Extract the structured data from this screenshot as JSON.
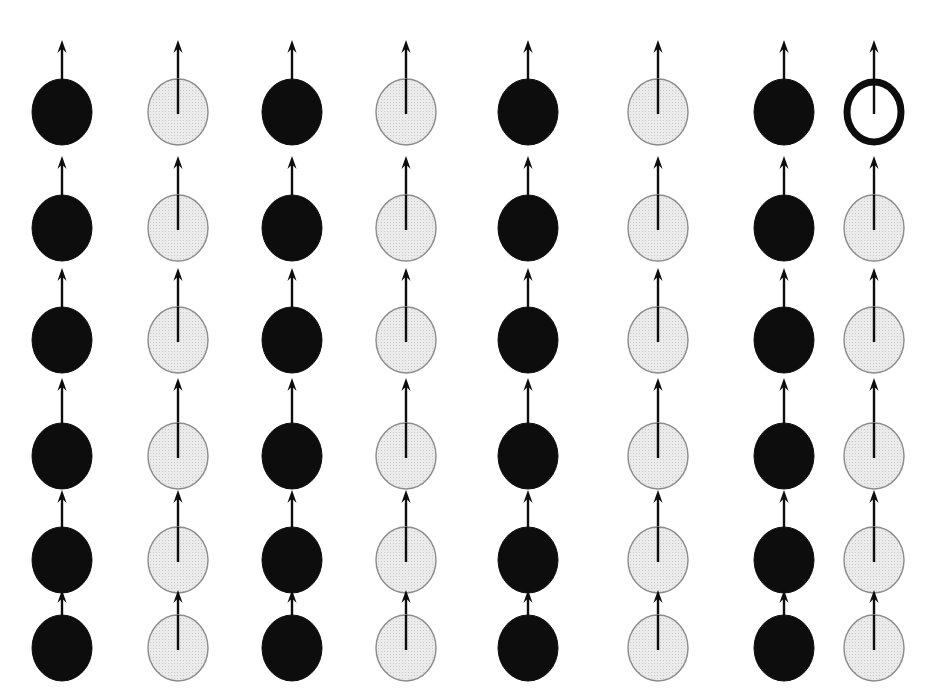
{
  "figure": {
    "canvas": {
      "width": 933,
      "height": 698
    },
    "background_color": "#ffffff"
  },
  "style": {
    "black_sphere_fill": "#0d0d0d",
    "black_sphere_stroke": "#0d0d0d",
    "grey_sphere_fill": "#ebebeb",
    "grey_sphere_stroke": "#8c8c8c",
    "open_circle_fill": "#ffffff",
    "open_circle_stroke": "#0d0d0d",
    "open_circle_stroke_width": 7,
    "arrow_color": "#0d0d0d",
    "arrow_shaft_width": 2.4,
    "grey_stipple_color": "#c9c9c9"
  },
  "lattice": {
    "rows": 6,
    "columns": 8,
    "sphere_radius_x": 30,
    "sphere_radius_y": 33,
    "column_centers_x": [
      62,
      178,
      292,
      406,
      528,
      658,
      784,
      874
    ],
    "row_centers_y": [
      112,
      228,
      340,
      456,
      560,
      648
    ],
    "column_kinds": [
      "black",
      "grey",
      "black",
      "grey",
      "black",
      "grey",
      "black",
      "grey"
    ],
    "arrow_lengths_by_row": [
      72,
      72,
      72,
      78,
      70,
      58
    ],
    "notes": {
      "row_gap_emphasis": "Larger vertical gap between row 3 and row 4",
      "column_gap_emphasis": "Columns 7 and 8 are spaced closer together than the other pairs",
      "bottom_row_clipped": "Bottom row spheres are clipped by the lower image edge"
    },
    "cells": [
      {
        "row": 1,
        "col": 1,
        "kind": "black",
        "arrow": "up"
      },
      {
        "row": 1,
        "col": 2,
        "kind": "grey",
        "arrow": "up"
      },
      {
        "row": 1,
        "col": 3,
        "kind": "black",
        "arrow": "up"
      },
      {
        "row": 1,
        "col": 4,
        "kind": "grey",
        "arrow": "up"
      },
      {
        "row": 1,
        "col": 5,
        "kind": "black",
        "arrow": "up"
      },
      {
        "row": 1,
        "col": 6,
        "kind": "grey",
        "arrow": "up"
      },
      {
        "row": 1,
        "col": 7,
        "kind": "black",
        "arrow": "up"
      },
      {
        "row": 1,
        "col": 8,
        "kind": "open",
        "arrow": "up"
      },
      {
        "row": 2,
        "col": 1,
        "kind": "black",
        "arrow": "up"
      },
      {
        "row": 2,
        "col": 2,
        "kind": "grey",
        "arrow": "up"
      },
      {
        "row": 2,
        "col": 3,
        "kind": "black",
        "arrow": "up"
      },
      {
        "row": 2,
        "col": 4,
        "kind": "grey",
        "arrow": "up"
      },
      {
        "row": 2,
        "col": 5,
        "kind": "black",
        "arrow": "up"
      },
      {
        "row": 2,
        "col": 6,
        "kind": "grey",
        "arrow": "up"
      },
      {
        "row": 2,
        "col": 7,
        "kind": "black",
        "arrow": "up"
      },
      {
        "row": 2,
        "col": 8,
        "kind": "grey",
        "arrow": "up"
      },
      {
        "row": 3,
        "col": 1,
        "kind": "black",
        "arrow": "up"
      },
      {
        "row": 3,
        "col": 2,
        "kind": "grey",
        "arrow": "up"
      },
      {
        "row": 3,
        "col": 3,
        "kind": "black",
        "arrow": "up"
      },
      {
        "row": 3,
        "col": 4,
        "kind": "grey",
        "arrow": "up"
      },
      {
        "row": 3,
        "col": 5,
        "kind": "black",
        "arrow": "up"
      },
      {
        "row": 3,
        "col": 6,
        "kind": "grey",
        "arrow": "up"
      },
      {
        "row": 3,
        "col": 7,
        "kind": "black",
        "arrow": "up"
      },
      {
        "row": 3,
        "col": 8,
        "kind": "grey",
        "arrow": "up"
      },
      {
        "row": 4,
        "col": 1,
        "kind": "black",
        "arrow": "up"
      },
      {
        "row": 4,
        "col": 2,
        "kind": "grey",
        "arrow": "up"
      },
      {
        "row": 4,
        "col": 3,
        "kind": "black",
        "arrow": "up"
      },
      {
        "row": 4,
        "col": 4,
        "kind": "grey",
        "arrow": "up"
      },
      {
        "row": 4,
        "col": 5,
        "kind": "black",
        "arrow": "up"
      },
      {
        "row": 4,
        "col": 6,
        "kind": "grey",
        "arrow": "up"
      },
      {
        "row": 4,
        "col": 7,
        "kind": "black",
        "arrow": "up"
      },
      {
        "row": 4,
        "col": 8,
        "kind": "grey",
        "arrow": "up"
      },
      {
        "row": 5,
        "col": 1,
        "kind": "black",
        "arrow": "up"
      },
      {
        "row": 5,
        "col": 2,
        "kind": "grey",
        "arrow": "up"
      },
      {
        "row": 5,
        "col": 3,
        "kind": "black",
        "arrow": "up"
      },
      {
        "row": 5,
        "col": 4,
        "kind": "grey",
        "arrow": "up"
      },
      {
        "row": 5,
        "col": 5,
        "kind": "black",
        "arrow": "up"
      },
      {
        "row": 5,
        "col": 6,
        "kind": "grey",
        "arrow": "up"
      },
      {
        "row": 5,
        "col": 7,
        "kind": "black",
        "arrow": "up"
      },
      {
        "row": 5,
        "col": 8,
        "kind": "grey",
        "arrow": "up"
      },
      {
        "row": 6,
        "col": 1,
        "kind": "black",
        "arrow": "up"
      },
      {
        "row": 6,
        "col": 2,
        "kind": "grey",
        "arrow": "up"
      },
      {
        "row": 6,
        "col": 3,
        "kind": "black",
        "arrow": "up"
      },
      {
        "row": 6,
        "col": 4,
        "kind": "grey",
        "arrow": "up"
      },
      {
        "row": 6,
        "col": 5,
        "kind": "black",
        "arrow": "up"
      },
      {
        "row": 6,
        "col": 6,
        "kind": "grey",
        "arrow": "up"
      },
      {
        "row": 6,
        "col": 7,
        "kind": "black",
        "arrow": "up"
      },
      {
        "row": 6,
        "col": 8,
        "kind": "grey",
        "arrow": "up"
      }
    ]
  }
}
